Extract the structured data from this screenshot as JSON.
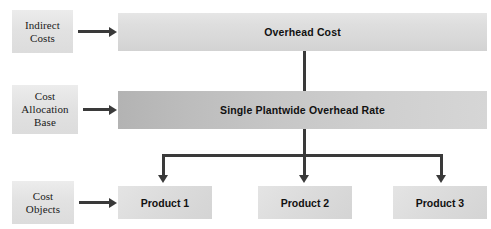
{
  "diagram": {
    "colors": {
      "connector": "#3a3a3a",
      "bar_light": "#dedede",
      "bar_dark": "#b3b3b3",
      "label_box": "#e2e2e2",
      "text": "#111111",
      "background": "#ffffff"
    }
  },
  "left_labels": [
    {
      "id": "indirect-costs",
      "text": "Indirect\nCosts",
      "line1": "Indirect",
      "line2": "Costs"
    },
    {
      "id": "cost-allocation-base",
      "text": "Cost Allocation Base",
      "line1": "Cost",
      "line2": "Allocation",
      "line3": "Base"
    },
    {
      "id": "cost-objects",
      "text": "Cost Objects",
      "line1": "Cost",
      "line2": "Objects"
    }
  ],
  "bars": [
    {
      "id": "overhead-cost",
      "label": "Overhead Cost"
    },
    {
      "id": "single-plantwide-overhead-rate",
      "label": "Single Plantwide Overhead Rate"
    }
  ],
  "products": [
    {
      "id": "product-1",
      "label": "Product 1"
    },
    {
      "id": "product-2",
      "label": "Product 2"
    },
    {
      "id": "product-3",
      "label": "Product 3"
    }
  ]
}
